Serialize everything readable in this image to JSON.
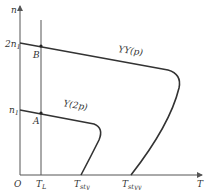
{
  "diagram": {
    "axes": {
      "y_label": "n",
      "x_label": "T",
      "origin_label": "O"
    },
    "y_ticks": [
      {
        "base": "2n",
        "sub": "1"
      },
      {
        "base": "n",
        "sub": "1"
      }
    ],
    "x_ticks": [
      {
        "base": "T",
        "sub": "L"
      },
      {
        "base": "T",
        "sub": "sty"
      },
      {
        "base": "T",
        "sub": "styy"
      }
    ],
    "points": [
      {
        "label": "B"
      },
      {
        "label": "A"
      }
    ],
    "curves": [
      {
        "label": "YY(p)"
      },
      {
        "label": "Y(2p)"
      }
    ],
    "colors": {
      "line": "#333333",
      "axis": "#555555",
      "background": "#ffffff"
    }
  }
}
